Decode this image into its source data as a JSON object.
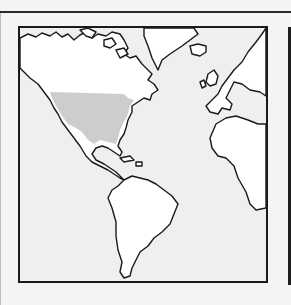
{
  "map": {
    "region": "Americas and Atlantic",
    "highlighted_region": "Contiguous United States (range)",
    "colors": {
      "ocean": "#efefef",
      "land": "#ffffff",
      "highlight": "#cdcdcd",
      "outline": "#1a1a1a",
      "page_background": "#f4f4f4"
    },
    "landmasses": [
      "North America",
      "Greenland",
      "Iceland",
      "Europe",
      "Africa",
      "South America",
      "Caribbean islands"
    ]
  }
}
